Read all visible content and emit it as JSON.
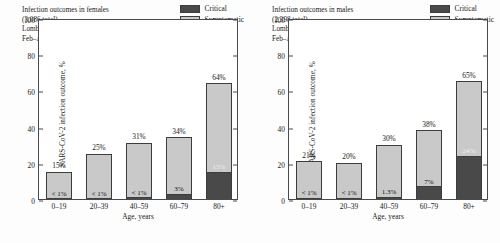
{
  "colors": {
    "critical": "#494949",
    "symptomatic": "#c9c9c9",
    "axis": "#4a4a4a",
    "background": "#fdfdfd"
  },
  "legend": {
    "critical_label": "Critical",
    "symptomatic_label": "Symptomatic"
  },
  "panels": [
    {
      "id": "females",
      "annotation": {
        "line1": "Infection outcomes in females",
        "line2": "(3,086 total)",
        "line3": "Lombardy region, Italy",
        "line4": "Feb–Apr 2020"
      },
      "chart_data": {
        "type": "bar",
        "stacked": true,
        "title": "Infection outcomes in females",
        "subtitle": "(3,086 total) Lombardy region, Italy Feb–Apr 2020",
        "xlabel": "Age, years",
        "ylabel": "SARS-CoV-2 infection outcome, %",
        "ylim": [
          0,
          100
        ],
        "yticks": [
          0,
          20,
          40,
          60,
          80,
          100
        ],
        "grid": false,
        "legend_position": "top-right",
        "categories": [
          "0–19",
          "20–39",
          "40–59",
          "60–79",
          "80+"
        ],
        "series": [
          {
            "name": "Critical",
            "values": [
              0.4,
              0.5,
              0.9,
              3.0,
              15.0
            ],
            "labels": [
              "< 1%",
              "< 1%",
              "< 1%",
              "3%",
              "15%"
            ]
          },
          {
            "name": "Symptomatic",
            "values": [
              15.0,
              25.0,
              31.0,
              34.0,
              64.0
            ],
            "labels": [
              "15%",
              "25%",
              "31%",
              "34%",
              "64%"
            ]
          }
        ]
      }
    },
    {
      "id": "males",
      "annotation": {
        "line1": "Infection outcomes in males",
        "line2": "(2,398 total)",
        "line3": "Lombardy region, Italy",
        "line4": "Feb–Apr 2020"
      },
      "chart_data": {
        "type": "bar",
        "stacked": true,
        "title": "Infection outcomes in males",
        "subtitle": "(2,398 total) Lombardy region, Italy Feb–Apr 2020",
        "xlabel": "Age, years",
        "ylabel": "SARS-CoV-2 infection outcome, %",
        "ylim": [
          0,
          100
        ],
        "yticks": [
          0,
          20,
          40,
          60,
          80,
          100
        ],
        "grid": false,
        "legend_position": "top-right",
        "categories": [
          "0–19",
          "20–39",
          "40–59",
          "60–79",
          "80+"
        ],
        "series": [
          {
            "name": "Critical",
            "values": [
              0.6,
              0.8,
              1.3,
              7.0,
              24.0
            ],
            "labels": [
              "< 1%",
              "< 1%",
              "1.3%",
              "7%",
              "24%"
            ]
          },
          {
            "name": "Symptomatic",
            "values": [
              21.0,
              20.0,
              30.0,
              38.0,
              65.0
            ],
            "labels": [
              "21%",
              "20%",
              "30%",
              "38%",
              "65%"
            ]
          }
        ]
      }
    }
  ]
}
